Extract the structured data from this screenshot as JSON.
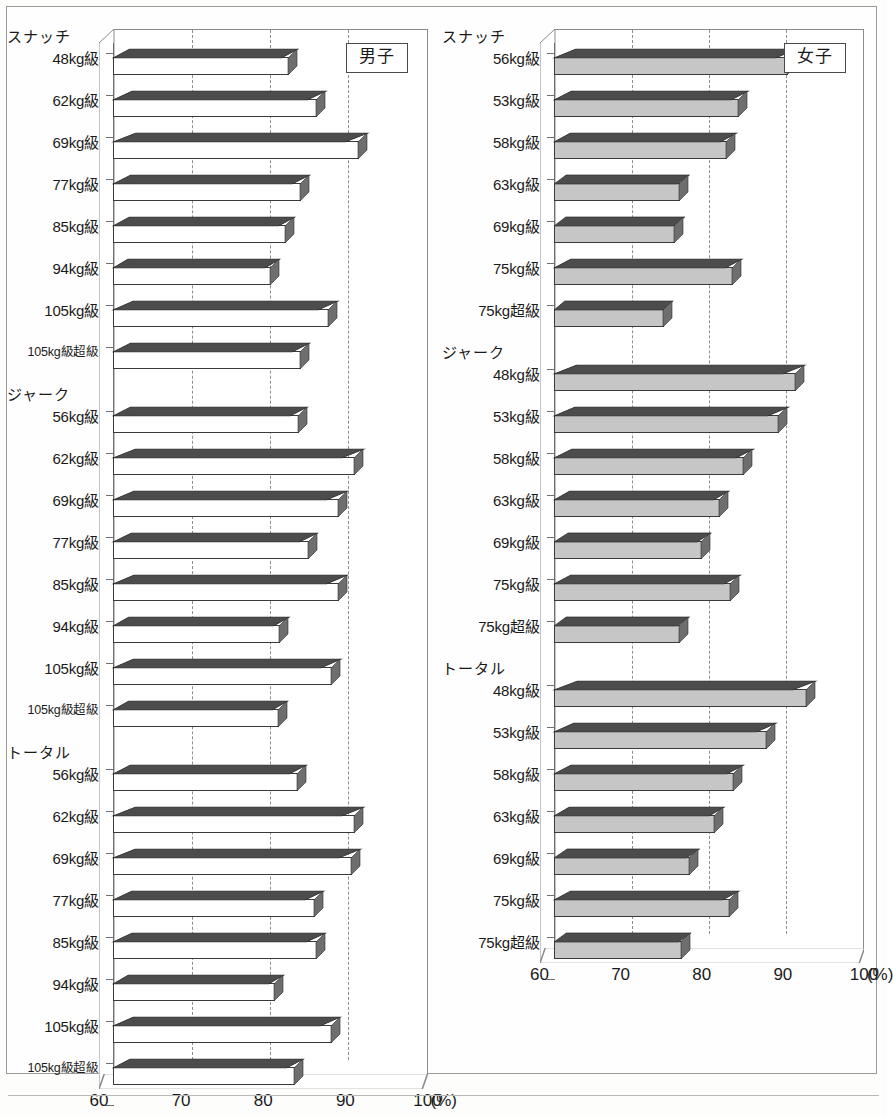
{
  "figure": {
    "panels": [
      {
        "id": "men",
        "legend": "男子",
        "bar_fill": "#ffffff",
        "bar_top": "#4c4c4c",
        "bar_side": "#6e6e6e",
        "groups": [
          {
            "title": "スナッチ",
            "categories": [
              "48kg級",
              "62kg級",
              "69kg級",
              "77kg級",
              "85kg級",
              "94kg級",
              "105kg級",
              "105kg級超級"
            ],
            "values": [
              82.4,
              86.0,
              91.3,
              83.9,
              82.0,
              80.1,
              87.5,
              83.9
            ]
          },
          {
            "title": "ジャーク",
            "categories": [
              "56kg級",
              "62kg級",
              "69kg級",
              "77kg級",
              "85kg級",
              "94kg級",
              "105kg級",
              "105kg級超級"
            ],
            "values": [
              83.6,
              90.8,
              88.7,
              84.9,
              88.7,
              81.3,
              87.9,
              81.1
            ]
          },
          {
            "title": "トータル",
            "categories": [
              "56kg級",
              "62kg級",
              "69kg級",
              "77kg級",
              "85kg級",
              "94kg級",
              "105kg級",
              "105kg級超級"
            ],
            "values": [
              83.5,
              90.8,
              90.4,
              85.7,
              85.9,
              80.6,
              87.8,
              83.1
            ]
          }
        ]
      },
      {
        "id": "women",
        "legend": "女子",
        "bar_fill": "#c6c6c6",
        "bar_top": "#4c4c4c",
        "bar_side": "#6e6e6e",
        "groups": [
          {
            "title": "スナッチ",
            "categories": [
              "56kg級",
              "53kg級",
              "58kg級",
              "63kg級",
              "69kg級",
              "75kg級",
              "75kg超級"
            ],
            "values": [
              90.2,
              83.9,
              82.4,
              76.3,
              75.7,
              83.1,
              74.2
            ]
          },
          {
            "title": "ジャーク",
            "categories": [
              "48kg級",
              "53kg級",
              "58kg級",
              "63kg級",
              "69kg級",
              "75kg級",
              "75kg超級"
            ],
            "values": [
              91.2,
              89.1,
              84.6,
              81.4,
              79.1,
              82.9,
              76.3
            ]
          },
          {
            "title": "トータル",
            "categories": [
              "48kg級",
              "53kg級",
              "58kg級",
              "63kg級",
              "69kg級",
              "75kg級",
              "75kg超級"
            ],
            "values": [
              92.6,
              87.5,
              83.3,
              80.8,
              77.6,
              82.7,
              76.5
            ]
          }
        ]
      }
    ],
    "axis": {
      "ticks": [
        "60",
        "70",
        "80",
        "90",
        "100"
      ],
      "unit": "(%)",
      "min": 60,
      "max": 100,
      "gridlines": [
        70,
        80,
        90
      ]
    }
  },
  "chart_data": {
    "type": "bar",
    "orientation": "horizontal",
    "title": "",
    "xlabel": "(%)",
    "ylabel": "",
    "xlim": [
      60,
      100
    ],
    "xticks": [
      60,
      70,
      80,
      90,
      100
    ],
    "grid": "vertical dashed at 70, 80, 90",
    "legend_position": "inside top-right of each panel",
    "panels": [
      {
        "legend": "男子",
        "sections": [
          {
            "name": "スナッチ",
            "categories": [
              "48kg級",
              "62kg級",
              "69kg級",
              "77kg級",
              "85kg級",
              "94kg級",
              "105kg級",
              "105kg級超級"
            ],
            "values": [
              82.4,
              86.0,
              91.3,
              83.9,
              82.0,
              80.1,
              87.5,
              83.9
            ]
          },
          {
            "name": "ジャーク",
            "categories": [
              "56kg級",
              "62kg級",
              "69kg級",
              "77kg級",
              "85kg級",
              "94kg級",
              "105kg級",
              "105kg級超級"
            ],
            "values": [
              83.6,
              90.8,
              88.7,
              84.9,
              88.7,
              81.3,
              87.9,
              81.1
            ]
          },
          {
            "name": "トータル",
            "categories": [
              "56kg級",
              "62kg級",
              "69kg級",
              "77kg級",
              "85kg級",
              "94kg級",
              "105kg級",
              "105kg級超級"
            ],
            "values": [
              83.5,
              90.8,
              90.4,
              85.7,
              85.9,
              80.6,
              87.8,
              83.1
            ]
          }
        ]
      },
      {
        "legend": "女子",
        "sections": [
          {
            "name": "スナッチ",
            "categories": [
              "56kg級",
              "53kg級",
              "58kg級",
              "63kg級",
              "69kg級",
              "75kg級",
              "75kg超級"
            ],
            "values": [
              90.2,
              83.9,
              82.4,
              76.3,
              75.7,
              83.1,
              74.2
            ]
          },
          {
            "name": "ジャーク",
            "categories": [
              "48kg級",
              "53kg級",
              "58kg級",
              "63kg級",
              "69kg級",
              "75kg級",
              "75kg超級"
            ],
            "values": [
              91.2,
              89.1,
              84.6,
              81.4,
              79.1,
              82.9,
              76.3
            ]
          },
          {
            "name": "トータル",
            "categories": [
              "48kg級",
              "53kg級",
              "58kg級",
              "63kg級",
              "69kg級",
              "75kg級",
              "75kg超級"
            ],
            "values": [
              92.6,
              87.5,
              83.3,
              80.8,
              77.6,
              82.7,
              76.5
            ]
          }
        ]
      }
    ]
  }
}
